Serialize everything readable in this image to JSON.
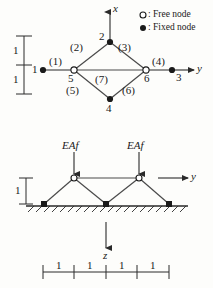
{
  "figure": {
    "stroke_color": "#2a2a2a",
    "fill_fixed": "#1a1a1a",
    "fill_free": "#ffffff"
  },
  "legend": {
    "free": {
      "marker": "open-circle-icon",
      "label": ": Free node"
    },
    "fixed": {
      "marker": "filled-circle-icon",
      "label": ": Fixed node"
    }
  },
  "top_view": {
    "axes": [
      {
        "name": "x",
        "label": "x",
        "direction": "up"
      },
      {
        "name": "y",
        "label": "y",
        "direction": "right"
      }
    ],
    "nodes": [
      {
        "id": "1",
        "label": "1",
        "type": "fixed"
      },
      {
        "id": "2",
        "label": "2",
        "type": "fixed"
      },
      {
        "id": "3",
        "label": "3",
        "type": "fixed"
      },
      {
        "id": "4",
        "label": "4",
        "type": "fixed"
      },
      {
        "id": "5",
        "label": "5",
        "type": "free"
      },
      {
        "id": "6",
        "label": "6",
        "type": "free"
      }
    ],
    "members": [
      {
        "id": "1",
        "label": "(1)"
      },
      {
        "id": "2",
        "label": "(2)"
      },
      {
        "id": "3",
        "label": "(3)"
      },
      {
        "id": "4",
        "label": "(4)"
      },
      {
        "id": "5",
        "label": "(5)"
      },
      {
        "id": "6",
        "label": "(6)"
      },
      {
        "id": "7",
        "label": "(7)"
      }
    ],
    "vertical_dimensions": [
      {
        "label": "1"
      },
      {
        "label": "1"
      }
    ]
  },
  "side_view": {
    "loads": [
      {
        "label": "EAf",
        "direction": "down"
      },
      {
        "label": "EAf",
        "direction": "down"
      }
    ],
    "axes": [
      {
        "name": "y",
        "label": "y",
        "direction": "right"
      },
      {
        "name": "z",
        "label": "z",
        "direction": "down"
      }
    ],
    "height_dimension": {
      "label": "1"
    },
    "span_dimensions": [
      {
        "label": "1"
      },
      {
        "label": "1"
      },
      {
        "label": "1"
      },
      {
        "label": "1"
      }
    ]
  }
}
